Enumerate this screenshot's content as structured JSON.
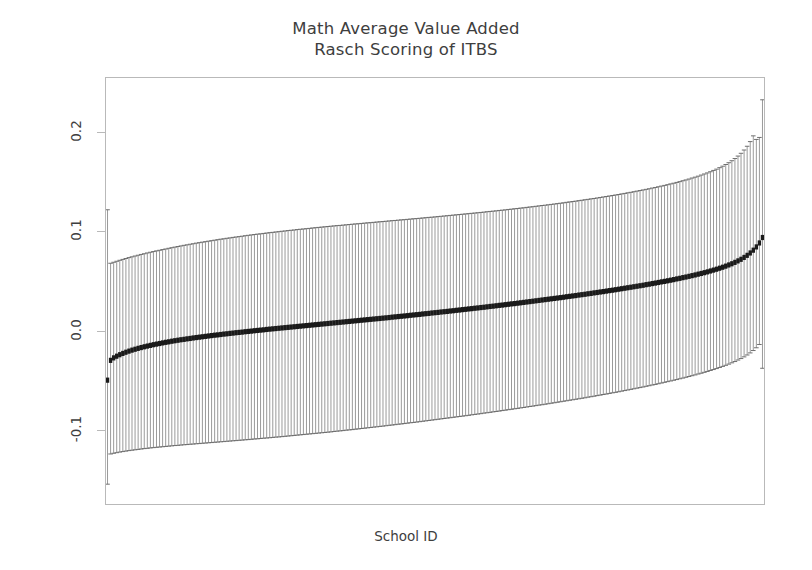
{
  "title": {
    "line1": "Math Average Value Added",
    "line2": "Rasch Scoring of ITBS"
  },
  "axes": {
    "y_title": "Average Value Added",
    "x_title": "School ID"
  },
  "chart_data": {
    "type": "scatter",
    "title": "Math Average Value Added\nRasch Scoring of ITBS",
    "subtitle": "Rasch Scoring of ITBS",
    "xlabel": "School ID",
    "ylabel": "Average Value Added",
    "grid": false,
    "legend": "none",
    "xlim": [
      0,
      216
    ],
    "ylim": [
      -0.175,
      0.255
    ],
    "ytick_values": [
      -0.1,
      0.0,
      0.1,
      0.2
    ],
    "ytick_labels": [
      "-0.1",
      "0.0",
      "0.1",
      "0.2"
    ],
    "xtick_values": [],
    "xtick_labels": [],
    "n_points": 215,
    "point_marker": "filled-square",
    "point_color": "#1a1a1a",
    "errorbar_color": "#9a9a9a",
    "errorbar_cap_color": "#6e6e6e",
    "series": [
      {
        "name": "Average Value Added (point estimate)",
        "values": [
          -0.05,
          -0.03,
          -0.0275,
          -0.0258,
          -0.0243,
          -0.023,
          -0.0218,
          -0.0207,
          -0.0197,
          -0.0188,
          -0.0179,
          -0.0171,
          -0.0163,
          -0.0156,
          -0.0149,
          -0.0142,
          -0.0136,
          -0.013,
          -0.0124,
          -0.0118,
          -0.0113,
          -0.0107,
          -0.0102,
          -0.0097,
          -0.0092,
          -0.0088,
          -0.0083,
          -0.0079,
          -0.0074,
          -0.007,
          -0.0066,
          -0.0062,
          -0.0058,
          -0.0054,
          -0.005,
          -0.0046,
          -0.0043,
          -0.0039,
          -0.0035,
          -0.0032,
          -0.0028,
          -0.0025,
          -0.0021,
          -0.0018,
          -0.0015,
          -0.0011,
          -0.0008,
          -0.0005,
          -0.0001,
          0.0002,
          0.0005,
          0.0008,
          0.0012,
          0.0015,
          0.0018,
          0.0021,
          0.0024,
          0.0027,
          0.003,
          0.0033,
          0.0036,
          0.0039,
          0.0042,
          0.0045,
          0.0048,
          0.0051,
          0.0054,
          0.0057,
          0.006,
          0.0063,
          0.0066,
          0.0069,
          0.0072,
          0.0075,
          0.0078,
          0.0081,
          0.0084,
          0.0087,
          0.009,
          0.0093,
          0.0096,
          0.0099,
          0.0102,
          0.0105,
          0.0108,
          0.0111,
          0.0114,
          0.0117,
          0.012,
          0.0123,
          0.0126,
          0.0129,
          0.0132,
          0.0136,
          0.0139,
          0.0142,
          0.0145,
          0.0148,
          0.0151,
          0.0155,
          0.0158,
          0.0161,
          0.0164,
          0.0168,
          0.0171,
          0.0174,
          0.0178,
          0.0181,
          0.0184,
          0.0188,
          0.0191,
          0.0194,
          0.0198,
          0.0201,
          0.0205,
          0.0208,
          0.0212,
          0.0215,
          0.0219,
          0.0222,
          0.0226,
          0.0229,
          0.0233,
          0.0236,
          0.024,
          0.0244,
          0.0247,
          0.0251,
          0.0255,
          0.0258,
          0.0262,
          0.0266,
          0.027,
          0.0273,
          0.0277,
          0.0281,
          0.0285,
          0.0289,
          0.0293,
          0.0297,
          0.0301,
          0.0305,
          0.0309,
          0.0313,
          0.0317,
          0.0321,
          0.0325,
          0.0329,
          0.0333,
          0.0337,
          0.0342,
          0.0346,
          0.035,
          0.0354,
          0.0359,
          0.0363,
          0.0367,
          0.0372,
          0.0376,
          0.0381,
          0.0385,
          0.039,
          0.0394,
          0.0399,
          0.0404,
          0.0408,
          0.0413,
          0.0418,
          0.0423,
          0.0428,
          0.0433,
          0.0438,
          0.0443,
          0.0448,
          0.0453,
          0.0458,
          0.0464,
          0.0469,
          0.0475,
          0.048,
          0.0486,
          0.0492,
          0.0497,
          0.0503,
          0.0509,
          0.0515,
          0.0522,
          0.0528,
          0.0535,
          0.0541,
          0.0548,
          0.0555,
          0.0562,
          0.057,
          0.0577,
          0.0585,
          0.0593,
          0.0602,
          0.0611,
          0.062,
          0.063,
          0.064,
          0.0651,
          0.0663,
          0.0675,
          0.0689,
          0.0704,
          0.072,
          0.0739,
          0.076,
          0.0784,
          0.0812,
          0.0845,
          0.0885,
          0.094
        ]
      },
      {
        "name": "95% CI lower bound",
        "values": [
          -0.155,
          -0.1245,
          -0.1238,
          -0.1232,
          -0.1226,
          -0.1221,
          -0.1216,
          -0.1211,
          -0.1207,
          -0.1203,
          -0.1199,
          -0.1195,
          -0.1191,
          -0.1188,
          -0.1184,
          -0.1181,
          -0.1178,
          -0.1175,
          -0.1172,
          -0.1169,
          -0.1166,
          -0.1163,
          -0.116,
          -0.1158,
          -0.1155,
          -0.1152,
          -0.115,
          -0.1147,
          -0.1145,
          -0.1142,
          -0.114,
          -0.1137,
          -0.1135,
          -0.1132,
          -0.113,
          -0.1127,
          -0.1125,
          -0.1122,
          -0.112,
          -0.1117,
          -0.1115,
          -0.1112,
          -0.111,
          -0.1107,
          -0.1105,
          -0.1102,
          -0.11,
          -0.1097,
          -0.1094,
          -0.1092,
          -0.1089,
          -0.1086,
          -0.1084,
          -0.1081,
          -0.1078,
          -0.1075,
          -0.1073,
          -0.107,
          -0.1067,
          -0.1064,
          -0.1061,
          -0.1058,
          -0.1055,
          -0.1052,
          -0.1049,
          -0.1046,
          -0.1043,
          -0.104,
          -0.1037,
          -0.1034,
          -0.1031,
          -0.1028,
          -0.1025,
          -0.1022,
          -0.1018,
          -0.1015,
          -0.1012,
          -0.1009,
          -0.1005,
          -0.1002,
          -0.0999,
          -0.0995,
          -0.0992,
          -0.0988,
          -0.0985,
          -0.0981,
          -0.0978,
          -0.0974,
          -0.0971,
          -0.0967,
          -0.0964,
          -0.096,
          -0.0956,
          -0.0953,
          -0.0949,
          -0.0945,
          -0.0942,
          -0.0938,
          -0.0934,
          -0.093,
          -0.0927,
          -0.0923,
          -0.0919,
          -0.0915,
          -0.0911,
          -0.0907,
          -0.0903,
          -0.0899,
          -0.0895,
          -0.0891,
          -0.0887,
          -0.0883,
          -0.0879,
          -0.0875,
          -0.0871,
          -0.0867,
          -0.0863,
          -0.0859,
          -0.0855,
          -0.085,
          -0.0846,
          -0.0842,
          -0.0838,
          -0.0833,
          -0.0829,
          -0.0825,
          -0.082,
          -0.0816,
          -0.0812,
          -0.0807,
          -0.0803,
          -0.0798,
          -0.0794,
          -0.0789,
          -0.0785,
          -0.078,
          -0.0776,
          -0.0771,
          -0.0766,
          -0.0762,
          -0.0757,
          -0.0752,
          -0.0748,
          -0.0743,
          -0.0738,
          -0.0733,
          -0.0728,
          -0.0723,
          -0.0718,
          -0.0713,
          -0.0708,
          -0.0703,
          -0.0698,
          -0.0693,
          -0.0688,
          -0.0683,
          -0.0678,
          -0.0672,
          -0.0667,
          -0.0662,
          -0.0656,
          -0.0651,
          -0.0645,
          -0.064,
          -0.0634,
          -0.0628,
          -0.0623,
          -0.0617,
          -0.0611,
          -0.0605,
          -0.0599,
          -0.0593,
          -0.0587,
          -0.0581,
          -0.0575,
          -0.0569,
          -0.0562,
          -0.0556,
          -0.0549,
          -0.0543,
          -0.0536,
          -0.0529,
          -0.0522,
          -0.0515,
          -0.0508,
          -0.0501,
          -0.0494,
          -0.0486,
          -0.0479,
          -0.0471,
          -0.0463,
          -0.0455,
          -0.0447,
          -0.0438,
          -0.043,
          -0.0421,
          -0.0412,
          -0.0402,
          -0.0393,
          -0.0383,
          -0.0372,
          -0.0361,
          -0.035,
          -0.0338,
          -0.0325,
          -0.0312,
          -0.0297,
          -0.0282,
          -0.0265,
          -0.0246,
          -0.0225,
          -0.0201,
          -0.0173,
          -0.014,
          -0.038
        ]
      },
      {
        "name": "95% CI upper bound",
        "values": [
          0.122,
          0.068,
          0.069,
          0.07,
          0.071,
          0.0719,
          0.0728,
          0.0737,
          0.0745,
          0.0753,
          0.0761,
          0.0769,
          0.0776,
          0.0784,
          0.0791,
          0.0798,
          0.0805,
          0.0811,
          0.0818,
          0.0824,
          0.0831,
          0.0837,
          0.0843,
          0.0849,
          0.0855,
          0.0861,
          0.0866,
          0.0872,
          0.0877,
          0.0883,
          0.0888,
          0.0893,
          0.0898,
          0.0903,
          0.0908,
          0.0913,
          0.0918,
          0.0923,
          0.0927,
          0.0932,
          0.0936,
          0.0941,
          0.0945,
          0.0949,
          0.0953,
          0.0958,
          0.0962,
          0.0966,
          0.097,
          0.0974,
          0.0977,
          0.0981,
          0.0985,
          0.0989,
          0.0992,
          0.0996,
          0.0999,
          0.1003,
          0.1006,
          0.101,
          0.1013,
          0.1016,
          0.102,
          0.1023,
          0.1026,
          0.1029,
          0.1032,
          0.1036,
          0.1039,
          0.1042,
          0.1045,
          0.1048,
          0.1051,
          0.1054,
          0.1057,
          0.106,
          0.1062,
          0.1065,
          0.1068,
          0.1071,
          0.1074,
          0.1077,
          0.1079,
          0.1082,
          0.1085,
          0.1088,
          0.109,
          0.1093,
          0.1096,
          0.1099,
          0.1101,
          0.1104,
          0.1107,
          0.111,
          0.1112,
          0.1115,
          0.1118,
          0.112,
          0.1123,
          0.1126,
          0.1129,
          0.1131,
          0.1134,
          0.1137,
          0.114,
          0.1143,
          0.1145,
          0.1148,
          0.1151,
          0.1154,
          0.1157,
          0.116,
          0.1163,
          0.1166,
          0.1169,
          0.1172,
          0.1175,
          0.1178,
          0.1181,
          0.1184,
          0.1187,
          0.119,
          0.1193,
          0.1196,
          0.12,
          0.1203,
          0.1206,
          0.1209,
          0.1213,
          0.1216,
          0.1219,
          0.1223,
          0.1226,
          0.123,
          0.1233,
          0.1237,
          0.124,
          0.1244,
          0.1248,
          0.1251,
          0.1255,
          0.1259,
          0.1263,
          0.1266,
          0.127,
          0.1274,
          0.1278,
          0.1282,
          0.1286,
          0.129,
          0.1295,
          0.1299,
          0.1303,
          0.1307,
          0.1312,
          0.1316,
          0.1321,
          0.1325,
          0.133,
          0.1334,
          0.1339,
          0.1344,
          0.1349,
          0.1354,
          0.1359,
          0.1364,
          0.1369,
          0.1374,
          0.138,
          0.1385,
          0.1391,
          0.1396,
          0.1402,
          0.1408,
          0.1414,
          0.142,
          0.1426,
          0.1432,
          0.1439,
          0.1445,
          0.1452,
          0.1459,
          0.1466,
          0.1473,
          0.1481,
          0.1488,
          0.1496,
          0.1504,
          0.1513,
          0.1521,
          0.153,
          0.154,
          0.1549,
          0.1559,
          0.157,
          0.1581,
          0.1592,
          0.1604,
          0.1617,
          0.163,
          0.1645,
          0.166,
          0.1677,
          0.1695,
          0.1715,
          0.1737,
          0.1762,
          0.179,
          0.1823,
          0.1861,
          0.1908,
          0.1966,
          0.193,
          0.195,
          0.233
        ]
      }
    ],
    "annotations": [
      {
        "text": "first school is a low outlier with a very wide interval",
        "x": 1,
        "y": -0.05
      },
      {
        "text": "last school is a high outlier with a very wide interval",
        "x": 215,
        "y": 0.14
      }
    ]
  }
}
